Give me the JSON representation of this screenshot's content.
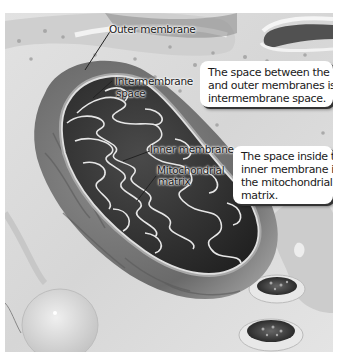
{
  "figure": {
    "labels": {
      "outer_membrane": "Outer membrane",
      "intermembrane_space_line1": "Intermembrane",
      "intermembrane_space_line2": "space",
      "inner_membrane": "Inner membrane",
      "matrix_line1": "Mitochondrial",
      "matrix_line2": "matrix"
    },
    "callouts": [
      {
        "lines": [
          "The space between the inner",
          "and outer membranes is the",
          "intermembrane space."
        ]
      },
      {
        "lines": [
          "The space inside the",
          "inner membrane is",
          "the mitochondrial",
          "matrix."
        ]
      }
    ],
    "colors": {
      "background": "#dcdcdc",
      "membrane_outer": "#7a7a7a",
      "matrix_dark": "#2a2a2a",
      "cristae_line": "#e6e6e6",
      "callout_bg": "#ffffff",
      "callout_shadow": "#333333"
    }
  }
}
